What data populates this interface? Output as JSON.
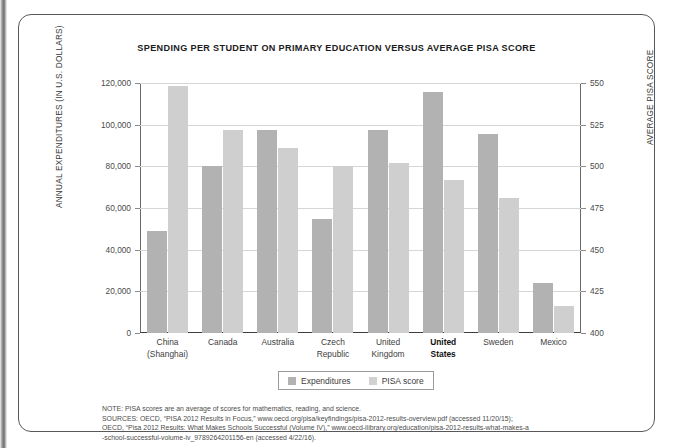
{
  "figure": {
    "title": "SPENDING PER STUDENT ON PRIMARY EDUCATION  VERSUS AVERAGE PISA SCORE"
  },
  "legend": {
    "expenditures_label": "Expenditures",
    "pisa_label": "PISA score"
  },
  "notes": {
    "line1": "NOTE: PISA scores are an average of scores for mathematics, reading, and science.",
    "line2": "SOURCES: OECD, “PISA 2012 Results in Focus,” www.oecd.org/pisa/keyfindings/pisa-2012-results-overview.pdf (accessed 11/20/15);",
    "line3": "OECD, “Pisa 2012 Results: What Makes Schools Successful (Volume IV),” www.oecd-ilibrary.org/education/pisa-2012-results-what-makes-a",
    "line4": "-school-successful-volume-iv_9789264201156-en (accessed 4/22/16)."
  },
  "chart_data": {
    "type": "bar",
    "title": "SPENDING PER STUDENT ON PRIMARY EDUCATION  VERSUS AVERAGE PISA SCORE",
    "xlabel": "",
    "ylabel": "ANNUAL EXPENDITURES (IN U.S. DOLLARS)",
    "y2label": "AVERAGE PISA SCORE",
    "grid": true,
    "legend_position": "bottom-center",
    "ylim": [
      0,
      120000
    ],
    "y2lim": [
      400,
      550
    ],
    "yticks": [
      0,
      20000,
      40000,
      60000,
      80000,
      100000,
      120000
    ],
    "ytick_labels": [
      "0",
      "20,000",
      "40,000",
      "60,000",
      "80,000",
      "100,000",
      "120,000"
    ],
    "y2ticks": [
      400,
      425,
      450,
      475,
      500,
      525,
      550
    ],
    "y2tick_labels": [
      "400",
      "425",
      "450",
      "475",
      "500",
      "525",
      "550"
    ],
    "categories": [
      "China\n(Shanghai)",
      "Canada",
      "Australia",
      "Czech\nRepublic",
      "United\nKingdom",
      "United\nStates",
      "Sweden",
      "Mexico"
    ],
    "category_lines": [
      [
        "China",
        "(Shanghai)"
      ],
      [
        "Canada",
        ""
      ],
      [
        "Australia",
        ""
      ],
      [
        "Czech",
        "Republic"
      ],
      [
        "United",
        "Kingdom"
      ],
      [
        "United",
        "States"
      ],
      [
        "Sweden",
        ""
      ],
      [
        "Mexico",
        ""
      ]
    ],
    "highlighted_category": "United States",
    "series": [
      {
        "name": "Expenditures",
        "axis": "left",
        "color": "#b2b2b2",
        "values": [
          49000,
          80000,
          97500,
          54500,
          97500,
          115500,
          95500,
          24000
        ]
      },
      {
        "name": "PISA score",
        "axis": "right",
        "color": "#cfcfcf",
        "values": [
          548,
          522,
          511,
          500,
          502,
          492,
          481,
          416
        ]
      }
    ]
  }
}
